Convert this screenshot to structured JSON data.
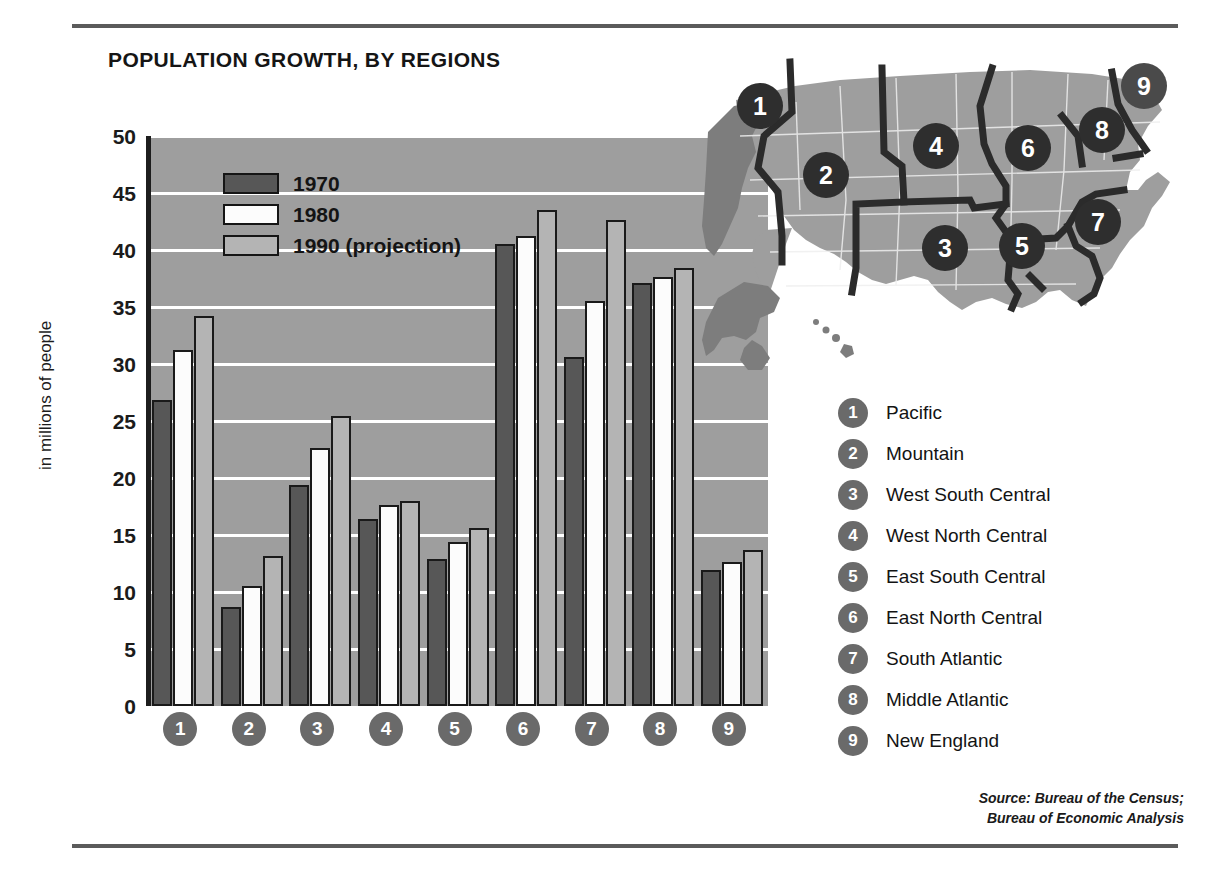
{
  "title": "POPULATION GROWTH, BY REGIONS",
  "yaxis_title": "in millions of people",
  "legend": [
    {
      "key": "y1970",
      "label": "1970"
    },
    {
      "key": "y1980",
      "label": "1980"
    },
    {
      "key": "y1990",
      "label": "1990 (projection)"
    }
  ],
  "colors": {
    "y1970": "#575757",
    "y1980": "#fcfcfc",
    "y1990": "#b4b4b4",
    "plot_background": "#9e9e9e",
    "gridline": "#ffffff",
    "axis": "#1d1d1d",
    "marker_circle": "#6a6a6a",
    "map_land": "#9e9e9e",
    "map_border": "#2b2b2b"
  },
  "regions": [
    {
      "number": "1",
      "name": "Pacific"
    },
    {
      "number": "2",
      "name": "Mountain"
    },
    {
      "number": "3",
      "name": "West South  Central"
    },
    {
      "number": "4",
      "name": "West North Central"
    },
    {
      "number": "5",
      "name": "East South Central"
    },
    {
      "number": "6",
      "name": "East North Central"
    },
    {
      "number": "7",
      "name": "South  Atlantic"
    },
    {
      "number": "8",
      "name": "Middle Atlantic"
    },
    {
      "number": "9",
      "name": "New England"
    }
  ],
  "source": {
    "line1": "Source: Bureau of the Census;",
    "line2": "Bureau of Economic Analysis"
  },
  "chart_data": {
    "type": "bar",
    "title": "POPULATION GROWTH, BY REGIONS",
    "xlabel": "",
    "ylabel": "in millions of people",
    "ylim": [
      0,
      50
    ],
    "yticks": [
      0,
      5,
      10,
      15,
      20,
      25,
      30,
      35,
      40,
      45,
      50
    ],
    "grid": true,
    "legend_position": "inside-top-left",
    "categories": [
      "1",
      "2",
      "3",
      "4",
      "5",
      "6",
      "7",
      "8",
      "9"
    ],
    "category_names": [
      "Pacific",
      "Mountain",
      "West South Central",
      "West North Central",
      "East South Central",
      "East North Central",
      "South Atlantic",
      "Middle Atlantic",
      "New England"
    ],
    "series": [
      {
        "name": "1970",
        "values": [
          26.8,
          8.7,
          19.4,
          16.4,
          12.9,
          40.5,
          30.6,
          37.1,
          11.9
        ]
      },
      {
        "name": "1980",
        "values": [
          31.2,
          10.5,
          22.6,
          17.6,
          14.4,
          41.2,
          35.5,
          37.6,
          12.6
        ]
      },
      {
        "name": "1990 (projection)",
        "values": [
          34.2,
          13.2,
          25.4,
          18.0,
          15.6,
          43.5,
          42.6,
          38.4,
          13.7
        ]
      }
    ]
  }
}
